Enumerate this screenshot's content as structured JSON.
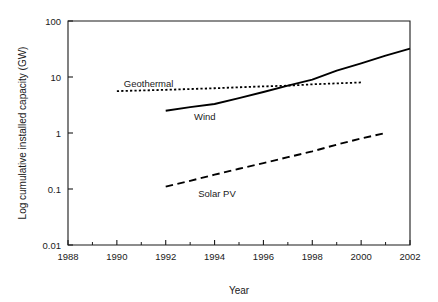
{
  "chart_data": {
    "type": "line",
    "title": "",
    "xlabel": "Year",
    "ylabel": "Log cumulative installed capacity (GW)",
    "xlim": [
      1988,
      2002
    ],
    "ylim": [
      0.01,
      100
    ],
    "yscale": "log",
    "grid": false,
    "legend_position": "inline-annotations",
    "xticks": [
      1988,
      1990,
      1992,
      1994,
      1996,
      1998,
      2000,
      2002
    ],
    "xtick_labels": [
      "1988",
      "1990",
      "1992",
      "1994",
      "1996",
      "1998",
      "2000",
      "2002"
    ],
    "xticks_minor": [
      1989,
      1991,
      1993,
      1995,
      1997,
      1999,
      2001
    ],
    "yticks": [
      0.01,
      0.1,
      1,
      10,
      100
    ],
    "ytick_labels": [
      "0.01",
      "0.1",
      "1",
      "10",
      "100"
    ],
    "series": [
      {
        "name": "Geothermal",
        "style": "dotted",
        "label": "Geothermal",
        "x": [
          1990,
          1992,
          1994,
          1996,
          1997,
          1998,
          2000
        ],
        "values": [
          5.6,
          5.9,
          6.3,
          6.8,
          7.0,
          7.4,
          8.0
        ]
      },
      {
        "name": "Wind",
        "style": "solid",
        "label": "Wind",
        "x": [
          1992,
          1993,
          1994,
          1995,
          1996,
          1997,
          1998,
          1999,
          2000,
          2001,
          2002
        ],
        "values": [
          2.5,
          2.9,
          3.3,
          4.2,
          5.4,
          7.0,
          9.0,
          13.0,
          17.5,
          24.0,
          32.0
        ]
      },
      {
        "name": "Solar PV",
        "style": "dashed",
        "label": "Solar PV",
        "x": [
          1992,
          1993,
          1994,
          1995,
          1996,
          1997,
          1998,
          1999,
          2000,
          2001
        ],
        "values": [
          0.11,
          0.14,
          0.18,
          0.23,
          0.29,
          0.37,
          0.47,
          0.62,
          0.8,
          1.0
        ]
      }
    ],
    "annotations": [
      {
        "text": "Geothermal",
        "x": 1991.3,
        "y": 7.6
      },
      {
        "text": "Wind",
        "x": 1993.6,
        "y": 1.95
      },
      {
        "text": "Solar PV",
        "x": 1994.1,
        "y": 0.082
      }
    ]
  },
  "colors": {
    "axis": "#1a1a1a",
    "series": "#000000",
    "background": "#ffffff"
  }
}
